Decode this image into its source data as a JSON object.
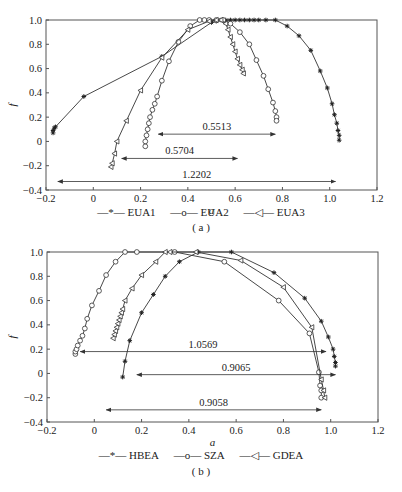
{
  "chart_data": [
    {
      "id": "a",
      "type": "line",
      "panel_label": "(a)",
      "title": "",
      "xlabel": "a",
      "ylabel": "f",
      "xlim": [
        -0.2,
        1.2
      ],
      "ylim": [
        -0.4,
        1.0
      ],
      "xticks": [
        "-0.2",
        "0",
        "0.2",
        "0.4",
        "0.6",
        "0.8",
        "1.0",
        "1.2"
      ],
      "yticks": [
        "-0.4",
        "-0.2",
        "0",
        "0.2",
        "0.4",
        "0.6",
        "0.8",
        "1.0"
      ],
      "grid": false,
      "legend_position": "bottom",
      "series": [
        {
          "name": "EUA1",
          "marker": "asterisk",
          "x": [
            -0.17,
            -0.17,
            -0.165,
            -0.16,
            -0.04,
            0.29,
            0.5,
            0.52,
            0.54,
            0.56,
            0.58,
            0.6,
            0.62,
            0.64,
            0.66,
            0.68,
            0.7,
            0.73,
            0.77,
            0.82,
            0.87,
            0.92,
            0.96,
            0.99,
            1.01,
            1.02,
            1.03,
            1.035,
            1.04,
            1.04
          ],
          "y": [
            0.07,
            0.09,
            0.11,
            0.12,
            0.37,
            0.7,
            0.98,
            0.99,
            1.0,
            1.0,
            1.0,
            1.0,
            1.0,
            1.0,
            1.0,
            1.0,
            1.0,
            1.0,
            1.0,
            0.95,
            0.87,
            0.75,
            0.58,
            0.44,
            0.31,
            0.22,
            0.15,
            0.09,
            0.05,
            0.01
          ]
        },
        {
          "name": "EUA2",
          "marker": "circle",
          "x": [
            0.22,
            0.22,
            0.225,
            0.23,
            0.235,
            0.24,
            0.25,
            0.26,
            0.27,
            0.29,
            0.32,
            0.36,
            0.41,
            0.45,
            0.47,
            0.49,
            0.52,
            0.55,
            0.58,
            0.62,
            0.66,
            0.69,
            0.72,
            0.74,
            0.76,
            0.77,
            0.775,
            0.775
          ],
          "y": [
            -0.04,
            0.0,
            0.05,
            0.1,
            0.15,
            0.2,
            0.26,
            0.31,
            0.37,
            0.5,
            0.66,
            0.82,
            0.95,
            1.0,
            1.0,
            1.0,
            1.0,
            1.0,
            0.97,
            0.9,
            0.8,
            0.67,
            0.54,
            0.43,
            0.32,
            0.25,
            0.2,
            0.17
          ]
        },
        {
          "name": "EUA3",
          "marker": "triangle-left",
          "x": [
            0.075,
            0.08,
            0.09,
            0.1,
            0.14,
            0.2,
            0.29,
            0.4,
            0.49,
            0.52,
            0.54,
            0.56,
            0.57,
            0.58,
            0.59,
            0.6,
            0.61,
            0.62,
            0.63,
            0.635
          ],
          "y": [
            -0.21,
            -0.18,
            -0.1,
            0.0,
            0.17,
            0.42,
            0.69,
            0.92,
            0.99,
            1.0,
            1.0,
            0.97,
            0.92,
            0.86,
            0.8,
            0.74,
            0.68,
            0.63,
            0.59,
            0.56
          ]
        }
      ],
      "annotations": [
        {
          "text": "0.5513",
          "x_from": 0.275,
          "x_to": 0.77,
          "y": 0.06
        },
        {
          "text": "0.5704",
          "x_from": 0.12,
          "x_to": 0.61,
          "y": -0.14
        },
        {
          "text": "1.2202",
          "x_from": -0.15,
          "x_to": 1.025,
          "y": -0.33
        }
      ]
    },
    {
      "id": "b",
      "type": "line",
      "panel_label": "(b)",
      "title": "",
      "xlabel": "a",
      "ylabel": "f",
      "xlim": [
        -0.2,
        1.2
      ],
      "ylim": [
        -0.4,
        1.0
      ],
      "xticks": [
        "-0.2",
        "0",
        "0.2",
        "0.4",
        "0.6",
        "0.8",
        "1.0",
        "1.2"
      ],
      "yticks": [
        "-0.4",
        "-0.2",
        "0",
        "0.2",
        "0.4",
        "0.6",
        "0.8",
        "1.0"
      ],
      "grid": false,
      "legend_position": "bottom",
      "series": [
        {
          "name": "HBEA",
          "marker": "asterisk",
          "x": [
            0.12,
            0.13,
            0.15,
            0.2,
            0.25,
            0.3,
            0.36,
            0.44,
            0.58,
            0.76,
            0.89,
            0.96,
            0.99,
            1.01,
            1.015,
            1.02,
            1.02
          ],
          "y": [
            -0.03,
            0.1,
            0.27,
            0.5,
            0.65,
            0.8,
            0.92,
            1.0,
            1.0,
            0.83,
            0.62,
            0.43,
            0.3,
            0.2,
            0.14,
            0.09,
            0.06
          ]
        },
        {
          "name": "SZA",
          "marker": "circle",
          "x": [
            -0.08,
            -0.08,
            -0.075,
            -0.07,
            -0.06,
            -0.05,
            -0.04,
            -0.03,
            -0.01,
            0.02,
            0.05,
            0.09,
            0.13,
            0.18,
            0.34,
            0.55,
            0.78,
            0.91,
            0.95,
            0.955,
            0.96,
            0.96
          ],
          "y": [
            0.16,
            0.18,
            0.2,
            0.23,
            0.27,
            0.31,
            0.37,
            0.45,
            0.56,
            0.68,
            0.81,
            0.92,
            1.0,
            1.0,
            1.0,
            0.92,
            0.6,
            0.33,
            0.01,
            -0.1,
            -0.14,
            -0.2
          ]
        },
        {
          "name": "GDEA",
          "marker": "triangle-left",
          "x": [
            0.08,
            0.085,
            0.09,
            0.095,
            0.1,
            0.105,
            0.11,
            0.115,
            0.12,
            0.13,
            0.16,
            0.2,
            0.26,
            0.3,
            0.32,
            0.43,
            0.62,
            0.8,
            0.92,
            0.96,
            0.97,
            0.975
          ],
          "y": [
            0.29,
            0.32,
            0.35,
            0.38,
            0.41,
            0.44,
            0.47,
            0.5,
            0.53,
            0.6,
            0.7,
            0.81,
            0.92,
            1.0,
            1.0,
            1.0,
            0.93,
            0.71,
            0.38,
            -0.05,
            -0.14,
            -0.2
          ]
        }
      ],
      "annotations": [
        {
          "text": "1.0569",
          "x_from": -0.06,
          "x_to": 0.98,
          "y": 0.18
        },
        {
          "text": "0.9065",
          "x_from": 0.18,
          "x_to": 1.02,
          "y": -0.01
        },
        {
          "text": "0.9058",
          "x_from": 0.05,
          "x_to": 0.96,
          "y": -0.3
        }
      ]
    }
  ],
  "legend_a": {
    "items": [
      "EUA1",
      "EUA2",
      "EUA3"
    ]
  },
  "legend_b": {
    "items": [
      "HBEA",
      "SZA",
      "GDEA"
    ]
  },
  "labels": {
    "panel_a": "( a )",
    "panel_b": "( b )"
  }
}
